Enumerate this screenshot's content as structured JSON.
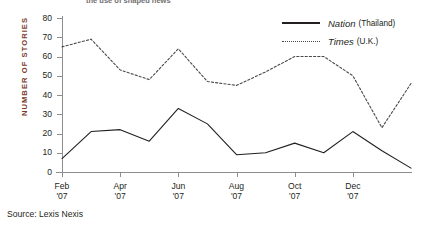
{
  "title": "the use of shaped news",
  "source_note": "Source: Lexis Nexis",
  "legend": {
    "items": [
      {
        "name": "Nation",
        "sub": "(Thailand)",
        "style": "solid",
        "color": "#231f20"
      },
      {
        "name": "Times",
        "sub": "(U.K.)",
        "style": "dotted",
        "color": "#4a4a4a"
      }
    ]
  },
  "axes": {
    "y_title": "NUMBER OF STORIES",
    "y_title_color": "#7a3a2b",
    "y_ticks": [
      "80",
      "70",
      "60",
      "50",
      "40",
      "30",
      "20",
      "10",
      "0"
    ],
    "x_ticks": [
      {
        "month": "Feb",
        "year": "'07"
      },
      {
        "month": "Apr",
        "year": "'07"
      },
      {
        "month": "Jun",
        "year": "'07"
      },
      {
        "month": "Aug",
        "year": "'07"
      },
      {
        "month": "Oct",
        "year": "'07"
      },
      {
        "month": "Dec",
        "year": "'07"
      }
    ]
  },
  "chart_data": {
    "type": "line",
    "title": "the use of shaped news",
    "xlabel": "",
    "ylabel": "NUMBER OF STORIES",
    "ylim": [
      0,
      80
    ],
    "ytick_step": 10,
    "grid": false,
    "legend_position": "top-right",
    "x": [
      "Feb '07",
      "Mar '07",
      "Apr '07",
      "May '07",
      "Jun '07",
      "Jul '07",
      "Aug '07",
      "Sep '07",
      "Oct '07",
      "Nov '07",
      "Dec '07",
      "Jan '08",
      "Feb '08"
    ],
    "series": [
      {
        "name": "Nation (Thailand)",
        "style": "solid",
        "color": "#231f20",
        "values": [
          7,
          21,
          22,
          16,
          33,
          25,
          9,
          10,
          15,
          10,
          21,
          11,
          2
        ]
      },
      {
        "name": "Times (U.K.)",
        "style": "dotted",
        "color": "#4a4a4a",
        "values": [
          65,
          69,
          53,
          48,
          64,
          47,
          45,
          52,
          60,
          60,
          50,
          23,
          46
        ]
      }
    ]
  }
}
